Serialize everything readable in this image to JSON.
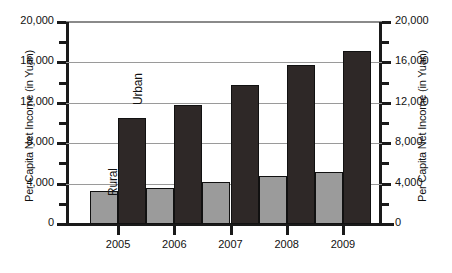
{
  "chart_data": {
    "type": "bar",
    "title": "",
    "xlabel": "",
    "ylabel": "Per Capita Net Income (in Yuan)",
    "ylabel_right": "Per Capita Net Income (in Yuan)",
    "categories": [
      "2005",
      "2006",
      "2007",
      "2008",
      "2009"
    ],
    "series": [
      {
        "name": "Rural",
        "values": [
          3255,
          3587,
          4140,
          4761,
          5153
        ],
        "color": "#9b9b9b"
      },
      {
        "name": "Urban",
        "values": [
          10493,
          11760,
          13786,
          15781,
          17175
        ],
        "color": "#2e2827"
      }
    ],
    "ylim": [
      0,
      20000
    ],
    "ytick_labels": [
      "0",
      "4,000",
      "8,000",
      "12,000",
      "16,000",
      "20,000"
    ],
    "ytick_values": [
      0,
      4000,
      8000,
      12000,
      16000,
      20000
    ],
    "yminor_values": [
      2000,
      6000,
      10000,
      14000,
      18000
    ],
    "grid": true,
    "legend": "inline-annotations",
    "annotations": [
      {
        "text": "Rural",
        "series": "Rural"
      },
      {
        "text": "Urban",
        "series": "Urban"
      }
    ]
  },
  "axis": {
    "left_title": "Per Capita Net Income (in Yuan)",
    "right_title": "Per Capita Net Income (in Yuan)"
  }
}
